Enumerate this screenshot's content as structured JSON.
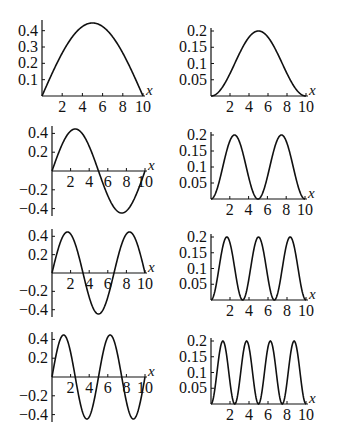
{
  "figure": {
    "x_axis_label": "x",
    "colors": {
      "curve": "#111111",
      "axis": "#111111",
      "background": "#ffffff"
    }
  },
  "chart_data": [
    {
      "id": "psi1",
      "type": "line",
      "row": 1,
      "col": 1,
      "title": "",
      "xlabel": "x",
      "ylabel": "",
      "xlim": [
        0,
        10
      ],
      "ylim": [
        0,
        0.447
      ],
      "x_ticks": [
        "2",
        "4",
        "6",
        "8",
        "10"
      ],
      "y_ticks": [
        "0.1",
        "0.2",
        "0.3",
        "0.4"
      ],
      "function": "sqrt(0.2)*sin(1*pi*x/10)",
      "n": 1,
      "squared": false,
      "x": [
        0,
        1,
        2,
        3,
        4,
        5,
        6,
        7,
        8,
        9,
        10
      ],
      "values": [
        0,
        0.138,
        0.263,
        0.362,
        0.425,
        0.447,
        0.425,
        0.362,
        0.263,
        0.138,
        0
      ]
    },
    {
      "id": "prob1",
      "type": "line",
      "row": 1,
      "col": 2,
      "title": "",
      "xlabel": "x",
      "ylabel": "",
      "xlim": [
        0,
        10
      ],
      "ylim": [
        0,
        0.2
      ],
      "x_ticks": [
        "2",
        "4",
        "6",
        "8",
        "10"
      ],
      "y_ticks": [
        "0.05",
        "0.1",
        "0.15",
        "0.2"
      ],
      "function": "0.2*sin(1*pi*x/10)^2",
      "n": 1,
      "squared": true,
      "x": [
        0,
        1,
        2,
        3,
        4,
        5,
        6,
        7,
        8,
        9,
        10
      ],
      "values": [
        0,
        0.019,
        0.069,
        0.131,
        0.181,
        0.2,
        0.181,
        0.131,
        0.069,
        0.019,
        0
      ]
    },
    {
      "id": "psi2",
      "type": "line",
      "row": 2,
      "col": 1,
      "title": "",
      "xlabel": "x",
      "ylabel": "",
      "xlim": [
        0,
        10
      ],
      "ylim": [
        -0.447,
        0.447
      ],
      "x_ticks": [
        "2",
        "4",
        "6",
        "8",
        "10"
      ],
      "y_ticks": [
        "-0.4",
        "-0.2",
        "0.2",
        "0.4"
      ],
      "function": "sqrt(0.2)*sin(2*pi*x/10)",
      "n": 2,
      "squared": false,
      "x": [
        0,
        1,
        2,
        3,
        4,
        5,
        6,
        7,
        8,
        9,
        10
      ],
      "values": [
        0,
        0.263,
        0.425,
        0.425,
        0.263,
        0,
        -0.263,
        -0.425,
        -0.425,
        -0.263,
        0
      ]
    },
    {
      "id": "prob2",
      "type": "line",
      "row": 2,
      "col": 2,
      "title": "",
      "xlabel": "x",
      "ylabel": "",
      "xlim": [
        0,
        10
      ],
      "ylim": [
        0,
        0.2
      ],
      "x_ticks": [
        "2",
        "4",
        "6",
        "8",
        "10"
      ],
      "y_ticks": [
        "0.05",
        "0.1",
        "0.15",
        "0.2"
      ],
      "function": "0.2*sin(2*pi*x/10)^2",
      "n": 2,
      "squared": true,
      "x": [
        0,
        1,
        2,
        3,
        4,
        5,
        6,
        7,
        8,
        9,
        10
      ],
      "values": [
        0,
        0.069,
        0.181,
        0.181,
        0.069,
        0,
        0.069,
        0.181,
        0.181,
        0.069,
        0
      ]
    },
    {
      "id": "psi3",
      "type": "line",
      "row": 3,
      "col": 1,
      "title": "",
      "xlabel": "x",
      "ylabel": "",
      "xlim": [
        0,
        10
      ],
      "ylim": [
        -0.447,
        0.447
      ],
      "x_ticks": [
        "2",
        "4",
        "6",
        "8",
        "10"
      ],
      "y_ticks": [
        "-0.4",
        "-0.2",
        "0.2",
        "0.4"
      ],
      "function": "sqrt(0.2)*sin(3*pi*x/10)",
      "n": 3,
      "squared": false,
      "x": [
        0,
        1,
        2,
        3,
        4,
        5,
        6,
        7,
        8,
        9,
        10
      ],
      "values": [
        0,
        0.362,
        0.425,
        0.138,
        -0.263,
        -0.447,
        -0.263,
        0.138,
        0.425,
        0.362,
        0
      ]
    },
    {
      "id": "prob3",
      "type": "line",
      "row": 3,
      "col": 2,
      "title": "",
      "xlabel": "x",
      "ylabel": "",
      "xlim": [
        0,
        10
      ],
      "ylim": [
        0,
        0.2
      ],
      "x_ticks": [
        "2",
        "4",
        "6",
        "8",
        "10"
      ],
      "y_ticks": [
        "0.05",
        "0.1",
        "0.15",
        "0.2"
      ],
      "function": "0.2*sin(3*pi*x/10)^2",
      "n": 3,
      "squared": true,
      "x": [
        0,
        1,
        2,
        3,
        4,
        5,
        6,
        7,
        8,
        9,
        10
      ],
      "values": [
        0,
        0.131,
        0.181,
        0.019,
        0.069,
        0.2,
        0.069,
        0.019,
        0.181,
        0.131,
        0
      ]
    },
    {
      "id": "psi4",
      "type": "line",
      "row": 4,
      "col": 1,
      "title": "",
      "xlabel": "x",
      "ylabel": "",
      "xlim": [
        0,
        10
      ],
      "ylim": [
        -0.447,
        0.447
      ],
      "x_ticks": [
        "2",
        "4",
        "6",
        "8",
        "10"
      ],
      "y_ticks": [
        "-0.4",
        "-0.2",
        "0.2",
        "0.4"
      ],
      "function": "sqrt(0.2)*sin(4*pi*x/10)",
      "n": 4,
      "squared": false,
      "x": [
        0,
        1,
        2,
        3,
        4,
        5,
        6,
        7,
        8,
        9,
        10
      ],
      "values": [
        0,
        0.425,
        0.263,
        -0.263,
        -0.425,
        0,
        0.425,
        0.263,
        -0.263,
        -0.425,
        0
      ]
    },
    {
      "id": "prob4",
      "type": "line",
      "row": 4,
      "col": 2,
      "title": "",
      "xlabel": "x",
      "ylabel": "",
      "xlim": [
        0,
        10
      ],
      "ylim": [
        0,
        0.2
      ],
      "x_ticks": [
        "2",
        "4",
        "6",
        "8",
        "10"
      ],
      "y_ticks": [
        "0.05",
        "0.1",
        "0.15",
        "0.2"
      ],
      "function": "0.2*sin(4*pi*x/10)^2",
      "n": 4,
      "squared": true,
      "x": [
        0,
        1,
        2,
        3,
        4,
        5,
        6,
        7,
        8,
        9,
        10
      ],
      "values": [
        0,
        0.181,
        0.069,
        0.069,
        0.181,
        0,
        0.181,
        0.069,
        0.069,
        0.181,
        0
      ]
    }
  ],
  "layout": {
    "panels": [
      {
        "id": "psi1",
        "x0": 42,
        "x10": 143,
        "y_zero": 96,
        "y_top": 23,
        "y_top_val": 0.447,
        "tick_y": 112
      },
      {
        "id": "prob1",
        "x0": 211,
        "x10": 306,
        "y_zero": 96,
        "y_top": 31,
        "y_top_val": 0.2,
        "tick_y": 112
      },
      {
        "id": "psi2",
        "x0": 52,
        "x10": 145,
        "y_zero": 171,
        "y_top": 129,
        "y_top_val": 0.447,
        "tick_y": 187
      },
      {
        "id": "prob2",
        "x0": 211,
        "x10": 305,
        "y_zero": 199,
        "y_top": 135,
        "y_top_val": 0.2,
        "tick_y": 215
      },
      {
        "id": "psi3",
        "x0": 52,
        "x10": 145,
        "y_zero": 273,
        "y_top": 232,
        "y_top_val": 0.447,
        "tick_y": 289
      },
      {
        "id": "prob3",
        "x0": 211,
        "x10": 306,
        "y_zero": 300,
        "y_top": 237,
        "y_top_val": 0.2,
        "tick_y": 316
      },
      {
        "id": "psi4",
        "x0": 52,
        "x10": 145,
        "y_zero": 377,
        "y_top": 335,
        "y_top_val": 0.447,
        "tick_y": 393
      },
      {
        "id": "prob4",
        "x0": 211,
        "x10": 306,
        "y_zero": 404,
        "y_top": 341,
        "y_top_val": 0.2,
        "tick_y": 420
      }
    ]
  }
}
